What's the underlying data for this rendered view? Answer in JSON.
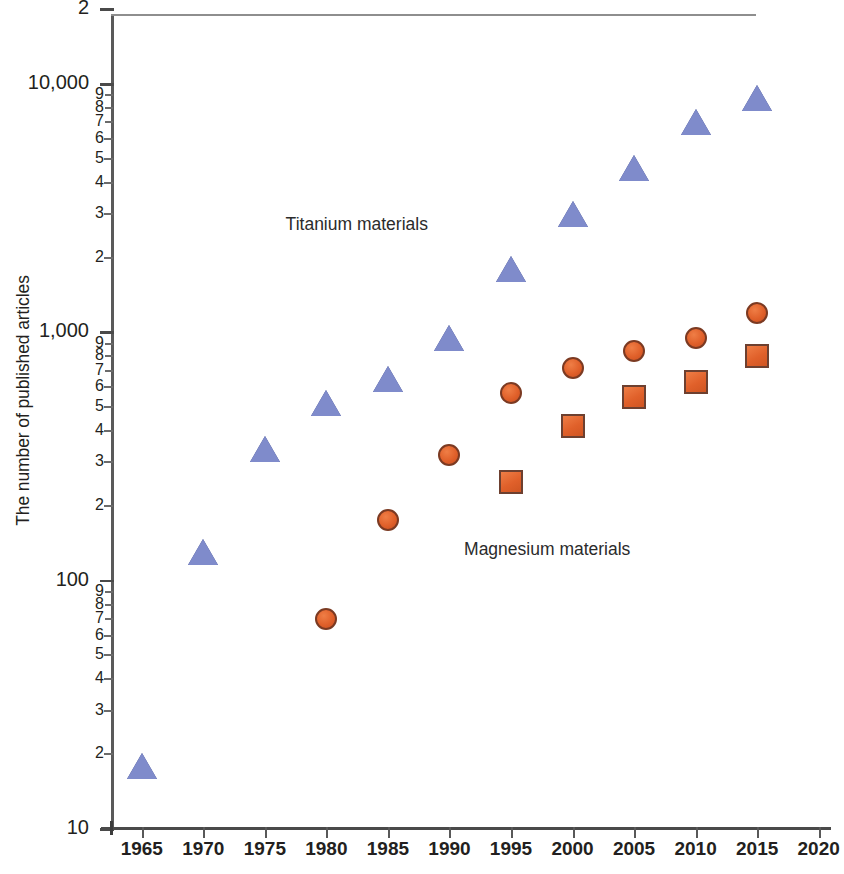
{
  "chart_data": {
    "type": "scatter",
    "title": "",
    "xlabel": "",
    "ylabel": "The number of published articles",
    "xlim": [
      1962.5,
      2021
    ],
    "ylim": [
      10,
      20000
    ],
    "yscale": "log",
    "grid": false,
    "legend_position": "inline-annotations",
    "x_ticks": [
      "1965",
      "1970",
      "1975",
      "1980",
      "1985",
      "1990",
      "1995",
      "2000",
      "2005",
      "2010",
      "2015",
      "2020"
    ],
    "y_major_ticks": [
      "10",
      "100",
      "1,000",
      "10,000"
    ],
    "y_minor_ticks": [
      "2",
      "3",
      "4",
      "5",
      "6",
      "7",
      "8",
      "9"
    ],
    "y_top_label": "2",
    "annotations": [
      {
        "text": "Titanium materials",
        "x": 1984.0,
        "y": 2700
      },
      {
        "text": "Magnesium materials",
        "x": 1998.5,
        "y": 133
      }
    ],
    "colors": {
      "titanium": "#7f8bcb",
      "titanium_edge": "#3f4a86",
      "magnesium": "#e0602a",
      "magnesium_edge": "#7b3a22",
      "axis": "#4a4a4a",
      "text": "#231f20"
    },
    "series": [
      {
        "name": "Titanium materials",
        "marker": "triangle",
        "color": "#7f8bcb",
        "points": [
          {
            "x": 1965,
            "y": 18
          },
          {
            "x": 1970,
            "y": 130
          },
          {
            "x": 1975,
            "y": 340
          },
          {
            "x": 1980,
            "y": 520
          },
          {
            "x": 1985,
            "y": 650
          },
          {
            "x": 1990,
            "y": 950
          },
          {
            "x": 1995,
            "y": 1800
          },
          {
            "x": 2000,
            "y": 3000
          },
          {
            "x": 2005,
            "y": 4600
          },
          {
            "x": 2010,
            "y": 7000
          },
          {
            "x": 2015,
            "y": 8800
          }
        ]
      },
      {
        "name": "Magnesium materials (circles)",
        "marker": "circle",
        "color": "#e0602a",
        "points": [
          {
            "x": 1980,
            "y": 70
          },
          {
            "x": 1985,
            "y": 175
          },
          {
            "x": 1990,
            "y": 320
          },
          {
            "x": 1995,
            "y": 570
          },
          {
            "x": 2000,
            "y": 720
          },
          {
            "x": 2005,
            "y": 840
          },
          {
            "x": 2010,
            "y": 950
          },
          {
            "x": 2015,
            "y": 1200
          }
        ]
      },
      {
        "name": "Magnesium materials (squares)",
        "marker": "square",
        "color": "#e0602a",
        "points": [
          {
            "x": 1995,
            "y": 250
          },
          {
            "x": 2000,
            "y": 420
          },
          {
            "x": 2005,
            "y": 550
          },
          {
            "x": 2010,
            "y": 630
          },
          {
            "x": 2015,
            "y": 800
          }
        ]
      }
    ]
  }
}
